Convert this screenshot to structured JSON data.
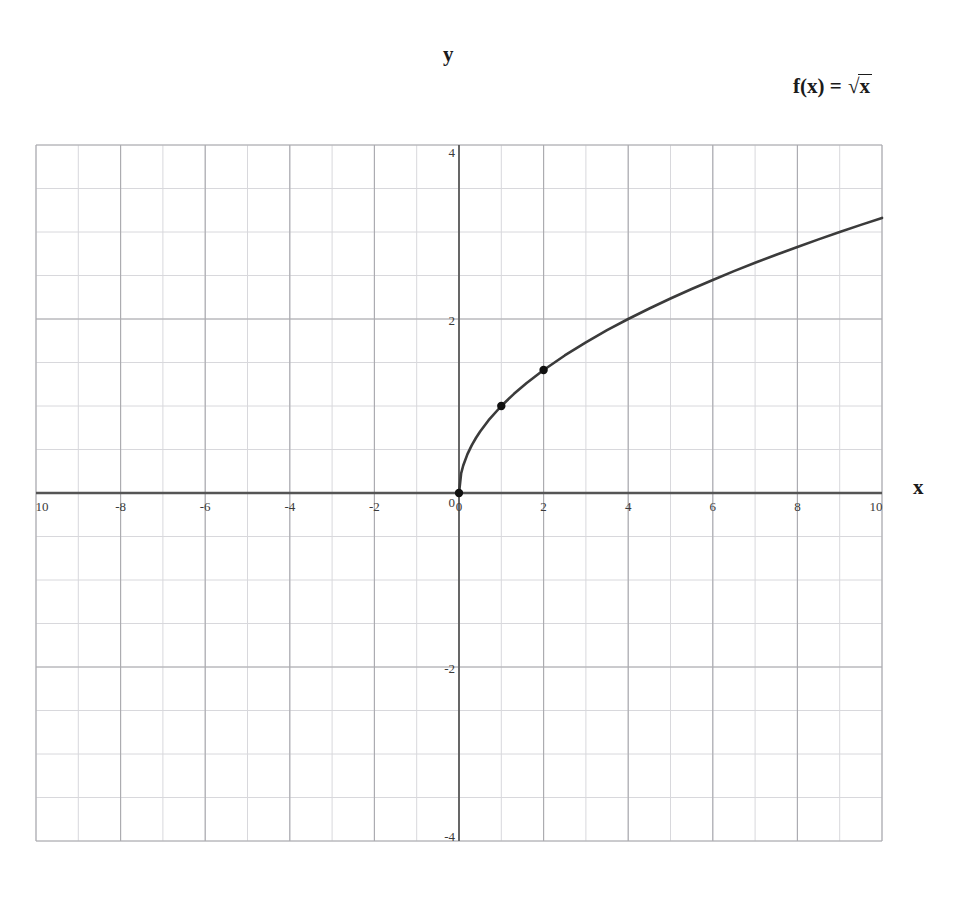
{
  "figure": {
    "y_axis_name": "y",
    "x_axis_name": "x",
    "function_label": {
      "lhs": "f(x)",
      "equals": "=",
      "radical": "√",
      "radicand": "x",
      "full": "f(x) = √x"
    }
  },
  "chart_data": {
    "type": "line",
    "title": "",
    "subtitle": "",
    "xlabel": "x",
    "ylabel": "y",
    "legend": [
      "f(x) = √x"
    ],
    "annotations": [
      "f(x) = √x"
    ],
    "grid": true,
    "grid_minor_step_x": 1,
    "grid_minor_step_y": 0.5,
    "grid_major_step_x": 2,
    "grid_major_step_y": 2,
    "xlim": [
      -10,
      10
    ],
    "ylim": [
      -4,
      4
    ],
    "xticks": [
      -10,
      -8,
      -6,
      -4,
      -2,
      0,
      2,
      4,
      6,
      8,
      10
    ],
    "yticks": [
      4,
      2,
      0,
      -2,
      -4
    ],
    "xtick_labels": [
      "10",
      "-8",
      "-6",
      "-4",
      "-2",
      "0",
      "2",
      "4",
      "6",
      "8",
      "10"
    ],
    "ytick_labels": [
      "4",
      "2",
      "0",
      "-2",
      "-4"
    ],
    "series": [
      {
        "name": "f(x) = √x",
        "color": "#3b3b3b",
        "x": [
          0,
          0.05,
          0.1,
          0.2,
          0.3,
          0.4,
          0.5,
          0.7,
          1,
          1.3,
          1.6,
          2,
          2.5,
          3,
          3.5,
          4,
          4.5,
          5,
          5.5,
          6,
          6.5,
          7,
          7.5,
          8,
          8.5,
          9,
          9.5,
          10
        ],
        "y": [
          0,
          0.224,
          0.316,
          0.447,
          0.548,
          0.632,
          0.707,
          0.837,
          1,
          1.14,
          1.265,
          1.414,
          1.581,
          1.732,
          1.871,
          2,
          2.121,
          2.236,
          2.345,
          2.449,
          2.55,
          2.646,
          2.739,
          2.828,
          2.915,
          3,
          3.082,
          3.162
        ]
      }
    ],
    "marked_points": [
      {
        "label": "(0, 0)",
        "x": 0,
        "y": 0
      },
      {
        "label": "(1, 1)",
        "x": 1,
        "y": 1
      },
      {
        "label": "(2, 1.41)",
        "x": 2,
        "y": 1.414
      }
    ],
    "colors": {
      "curve": "#3b3b3b",
      "point": "#111111",
      "axis": "#555555",
      "grid_minor": "#d8d8dc",
      "grid_major": "#a9a9ae",
      "background": "#ffffff",
      "text": "#1b1b1b"
    }
  }
}
